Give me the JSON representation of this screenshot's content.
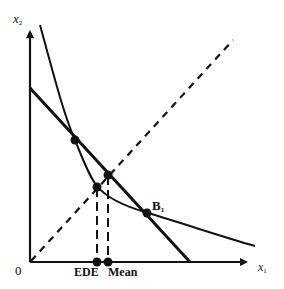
{
  "diagram": {
    "type": "economics-indifference-diagram",
    "axes": {
      "y_label": "x",
      "y_label_sub": "2",
      "x_label": "x",
      "x_label_sub": "1",
      "origin_label": "0"
    },
    "x_axis_markers": [
      {
        "label": "EDE"
      },
      {
        "label": "Mean"
      }
    ],
    "point_label": "B",
    "point_label_sub": "1",
    "elements": [
      "budget-line (thick straight line)",
      "indifference-curve (convex curve)",
      "45-degree equality line (dashed)",
      "dashed vertical projection to EDE",
      "dashed vertical projection to Mean"
    ],
    "colors": {
      "ink": "#111111",
      "background": "#ffffff"
    }
  }
}
